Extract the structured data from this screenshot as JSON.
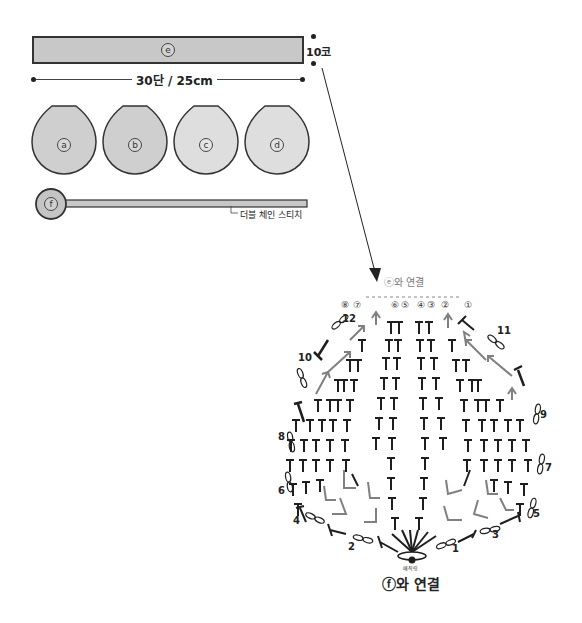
{
  "pieces": {
    "e": {
      "label": "e",
      "fill": "#c8c8c8"
    },
    "circles": [
      {
        "label": "a",
        "fill": "#cfcfcf"
      },
      {
        "label": "b",
        "fill": "#cfcfcf"
      },
      {
        "label": "c",
        "fill": "#dedede"
      },
      {
        "label": "d",
        "fill": "#dedede"
      }
    ],
    "f": {
      "label": "f",
      "fill": "#c4c4c4"
    }
  },
  "dimensions": {
    "width_label": "30단 / 25cm",
    "height_label": "10코"
  },
  "f_strap_label": "더블 체인 스티치",
  "chart": {
    "top_label": "ⓔ와 연결",
    "bottom_label": "ⓕ와 연결",
    "start_label": "매직링",
    "column_markers": [
      "⑧",
      "⑦",
      "⑥",
      "⑤",
      "④",
      "③",
      "②",
      "①"
    ],
    "round_numbers": [
      "1",
      "2",
      "3",
      "4",
      "5",
      "6",
      "7",
      "8",
      "9",
      "10",
      "11",
      "12"
    ]
  },
  "colors": {
    "stitch_dark": "#1e1e1e",
    "stitch_gray": "#808080",
    "outline": "#333333"
  }
}
